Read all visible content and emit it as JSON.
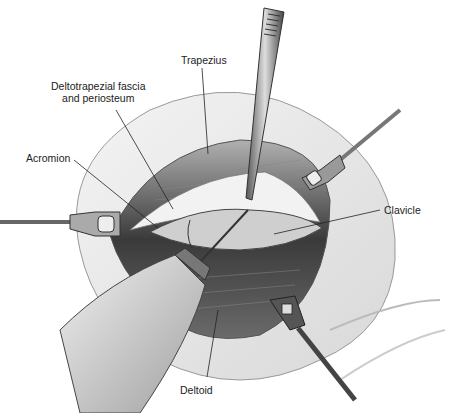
{
  "figure": {
    "type": "surgical-illustration",
    "labels": [
      {
        "id": "trapezius",
        "text": "Trapezius",
        "x": 181,
        "y": 60
      },
      {
        "id": "deltotrapezial",
        "line1": "Deltotrapezial fascia",
        "line2": "and periosteum",
        "x": 51,
        "y": 86
      },
      {
        "id": "acromion",
        "text": "Acromion",
        "x": 26,
        "y": 152
      },
      {
        "id": "clavicle",
        "text": "Clavicle",
        "x": 387,
        "y": 206
      },
      {
        "id": "deltoid",
        "text": "Deltoid",
        "x": 180,
        "y": 385
      }
    ],
    "instruments": [
      "forceps",
      "retractor-left",
      "retractor-upper-right",
      "retractor-lower-right",
      "electrocautery"
    ]
  }
}
